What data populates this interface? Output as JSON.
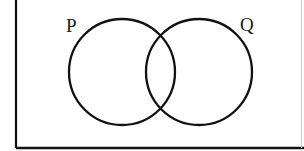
{
  "diagram": {
    "type": "venn",
    "sets": [
      {
        "id": "P",
        "label": "P",
        "cx": 122,
        "cy": 72,
        "r": 53
      },
      {
        "id": "Q",
        "label": "Q",
        "cx": 199,
        "cy": 72,
        "r": 53
      }
    ],
    "universal_set_frame": {
      "visible_edges": [
        "left",
        "bottom",
        "right"
      ]
    },
    "colors": {
      "stroke": "#111111",
      "background": "#ffffff",
      "right_edge": "#cfcfcf"
    }
  }
}
